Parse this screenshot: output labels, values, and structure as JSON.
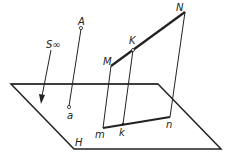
{
  "diagram": {
    "type": "descriptive-geometry parallel projection",
    "plane_label": "H",
    "projection_direction_label": "S∞",
    "points": {
      "A": "A",
      "a": "a",
      "M": "M",
      "N": "N",
      "K": "K",
      "m": "m",
      "n": "n",
      "k": "k"
    },
    "colors": {
      "stroke": "#222222",
      "background": "#ffffff"
    }
  }
}
